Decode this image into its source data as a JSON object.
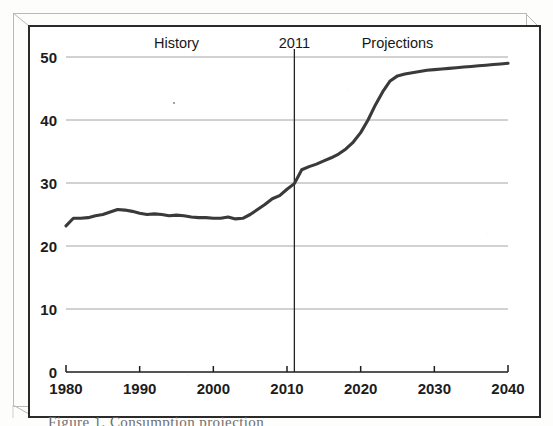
{
  "figure": {
    "kind": "scanned-line-chart",
    "frame_style": "3d-offset-box",
    "caption_partial": "Figure 1. Consumption projection"
  },
  "chart_data": {
    "type": "line",
    "title": "",
    "subtitle": "",
    "xlabel": "",
    "ylabel": "",
    "xlim": [
      1980,
      2040
    ],
    "ylim": [
      0,
      50
    ],
    "xticks": [
      1980,
      1990,
      2000,
      2010,
      2020,
      2030,
      2040
    ],
    "xtick_labels": [
      "1980",
      "1990",
      "2000",
      "2010",
      "2020",
      "2030",
      "2040"
    ],
    "yticks": [
      0,
      10,
      20,
      30,
      40,
      50
    ],
    "ytick_labels": [
      "0",
      "10",
      "20",
      "30",
      "40",
      "50"
    ],
    "grid": "horizontal",
    "legend": "none",
    "annotations": [
      {
        "name": "history-label",
        "text": "History",
        "x": 1995.0,
        "y": 52.0
      },
      {
        "name": "divider-year-label",
        "text": "2011",
        "x": 2011.0,
        "y": 52.0
      },
      {
        "name": "projections-label",
        "text": "Projections",
        "x": 2025.0,
        "y": 52.0
      }
    ],
    "vertical_divider": {
      "x": 2011,
      "label": "2011"
    },
    "series": [
      {
        "name": "value",
        "color": "#3a3a3a",
        "x": [
          1980,
          1981,
          1982,
          1983,
          1984,
          1985,
          1986,
          1987,
          1988,
          1989,
          1990,
          1991,
          1992,
          1993,
          1994,
          1995,
          1996,
          1997,
          1998,
          1999,
          2000,
          2001,
          2002,
          2003,
          2004,
          2005,
          2006,
          2007,
          2008,
          2009,
          2010,
          2011,
          2012,
          2013,
          2014,
          2015,
          2016,
          2017,
          2018,
          2019,
          2020,
          2021,
          2022,
          2023,
          2024,
          2025,
          2026,
          2027,
          2028,
          2029,
          2030,
          2031,
          2032,
          2033,
          2034,
          2035,
          2036,
          2037,
          2038,
          2039,
          2040
        ],
        "values": [
          23.2,
          24.4,
          24.4,
          24.5,
          24.8,
          25.0,
          25.4,
          25.8,
          25.7,
          25.5,
          25.2,
          25.0,
          25.1,
          25.0,
          24.8,
          24.9,
          24.8,
          24.6,
          24.5,
          24.5,
          24.4,
          24.4,
          24.6,
          24.3,
          24.4,
          25.0,
          25.8,
          26.6,
          27.5,
          28.0,
          29.0,
          29.9,
          32.1,
          32.6,
          33.0,
          33.5,
          34.0,
          34.6,
          35.4,
          36.5,
          38.0,
          40.0,
          42.4,
          44.5,
          46.2,
          47.0,
          47.3,
          47.5,
          47.7,
          47.9,
          48.0,
          48.1,
          48.2,
          48.3,
          48.4,
          48.5,
          48.6,
          48.7,
          48.8,
          48.9,
          49.0
        ]
      }
    ]
  }
}
